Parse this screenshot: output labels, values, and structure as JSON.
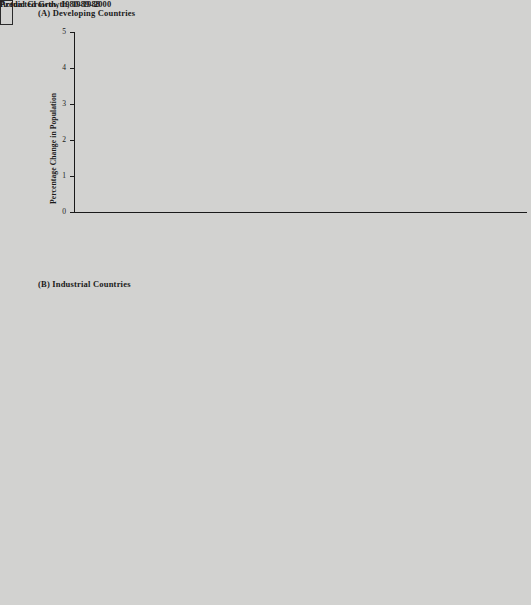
{
  "figure": {
    "panelA_title": "(A)  Developing Countries",
    "panelB_title": "(B)  Industrial Countries",
    "ylabel": "Percentage Change in Population",
    "colors": {
      "actual": "#565656",
      "predicted": "#8e8e8e",
      "background": "#d2d2d0",
      "axis": "#1a1a1a"
    }
  },
  "legend": {
    "actual_label": "Actual Growth, 1980–1988",
    "predicted_label": "Predicted Growth, 1989–2000"
  },
  "yticks": [
    "0",
    "1",
    "2",
    "3",
    "4",
    "5"
  ],
  "chart_data": [
    {
      "type": "bar",
      "title": "(A)  Developing Countries",
      "xlabel": "",
      "ylabel": "Percentage Change in Population",
      "ylim": [
        0,
        5
      ],
      "yticks": [
        0,
        1,
        2,
        3,
        4,
        5
      ],
      "grid": false,
      "legend_position": "panel-B-top-center",
      "categories": [
        "Ethiopia",
        "Bangladesh",
        "Nepal",
        "Nigeria",
        "China",
        "India",
        "Pakistan",
        "Kenya",
        "Haiti",
        "Sri Lanka",
        "Chili",
        "Mexico",
        "Argentina",
        "Iraq",
        "All low-income",
        "All middle-income"
      ],
      "series": [
        {
          "name": "Actual Growth, 1980–1988",
          "values": [
            2.9,
            2.75,
            2.6,
            3.3,
            1.3,
            2.2,
            3.2,
            3.8,
            1.8,
            1.5,
            1.7,
            2.2,
            1.4,
            3.6,
            2.0,
            2.2
          ]
        },
        {
          "name": "Predicted Growth, 1989–2000",
          "values": [
            3.3,
            2.35,
            2.45,
            3.1,
            1.3,
            1.8,
            3.1,
            3.4,
            1.9,
            1.1,
            1.3,
            1.9,
            1.1,
            3.4,
            1.9,
            1.9
          ]
        }
      ]
    },
    {
      "type": "bar",
      "title": "(B)  Industrial Countries",
      "xlabel": "",
      "ylabel": "Percentage Change in Population",
      "ylim": [
        0,
        5
      ],
      "yticks": [
        0,
        1,
        2,
        3,
        4,
        5
      ],
      "grid": false,
      "legend_position": "top-center",
      "categories": [
        "Ireland",
        "Australia",
        "United Kingdom",
        "Italy",
        "France",
        "Canada",
        "Germany, Fed. Rep.",
        "United States",
        "Japan",
        "All industrial"
      ],
      "series": [
        {
          "name": "Actual Growth, 1980–1988",
          "values": [
            0.5,
            1.4,
            0.2,
            0.2,
            0.4,
            0.92,
            -0.05,
            1.02,
            0.6,
            0.6
          ]
        },
        {
          "name": "Predicted Growth, 1989–2000",
          "values": [
            0.3,
            1.4,
            0.3,
            0.1,
            0.4,
            0.92,
            0.0,
            0.82,
            0.42,
            0.52
          ]
        }
      ]
    }
  ]
}
